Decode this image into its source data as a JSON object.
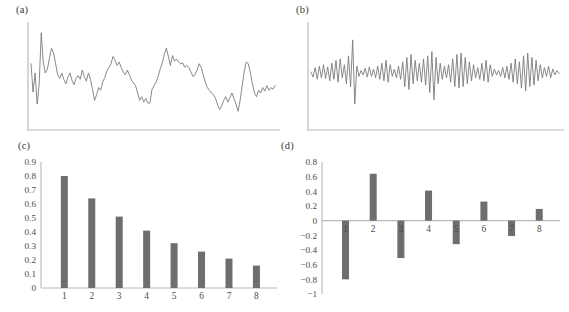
{
  "figure": {
    "background": "#ffffff",
    "line_color": "#7c7c7c",
    "axis_color": "#b9b9b9",
    "bar_color": "#6e6e6e",
    "text_color": "#4a4a4a"
  },
  "panels": {
    "a": {
      "label": "(a)"
    },
    "b": {
      "label": "(b)"
    },
    "c": {
      "label": "(c)"
    },
    "d": {
      "label": "(d)"
    }
  },
  "chart_data": [
    {
      "id": "a",
      "type": "line",
      "title": "(a)",
      "xlabel": "",
      "ylabel": "",
      "grid": false,
      "legend": null,
      "axis_ticks": false,
      "description": "Smoothly varying positively autocorrelated time series",
      "x": [
        0,
        1,
        2,
        3,
        4,
        5,
        6,
        7,
        8,
        9,
        10,
        11,
        12,
        13,
        14,
        15,
        16,
        17,
        18,
        19,
        20,
        21,
        22,
        23,
        24,
        25,
        26,
        27,
        28,
        29,
        30,
        31,
        32,
        33,
        34,
        35,
        36,
        37,
        38,
        39,
        40,
        41,
        42,
        43,
        44,
        45,
        46,
        47,
        48,
        49,
        50,
        51,
        52,
        53,
        54,
        55,
        56,
        57,
        58,
        59,
        60,
        61,
        62,
        63,
        64,
        65,
        66,
        67,
        68,
        69,
        70,
        71,
        72,
        73,
        74,
        75,
        76,
        77,
        78,
        79,
        80,
        81,
        82,
        83,
        84,
        85,
        86,
        87,
        88,
        89,
        90,
        91,
        92,
        93,
        94,
        95,
        96,
        97,
        98,
        99,
        100,
        101,
        102,
        103,
        104,
        105,
        106,
        107,
        108,
        109,
        110,
        111,
        112,
        113,
        114,
        115,
        116,
        117,
        118,
        119
      ],
      "values": [
        0.62,
        0.31,
        0.52,
        0.18,
        0.4,
        0.96,
        0.63,
        0.52,
        0.56,
        0.68,
        0.79,
        0.74,
        0.62,
        0.5,
        0.46,
        0.52,
        0.45,
        0.4,
        0.47,
        0.52,
        0.44,
        0.39,
        0.46,
        0.49,
        0.45,
        0.55,
        0.48,
        0.43,
        0.52,
        0.45,
        0.34,
        0.22,
        0.28,
        0.36,
        0.33,
        0.42,
        0.47,
        0.54,
        0.58,
        0.62,
        0.7,
        0.66,
        0.6,
        0.64,
        0.58,
        0.53,
        0.5,
        0.55,
        0.5,
        0.44,
        0.41,
        0.38,
        0.3,
        0.22,
        0.26,
        0.2,
        0.24,
        0.19,
        0.19,
        0.34,
        0.38,
        0.42,
        0.48,
        0.56,
        0.63,
        0.72,
        0.79,
        0.7,
        0.6,
        0.71,
        0.65,
        0.67,
        0.64,
        0.62,
        0.63,
        0.58,
        0.6,
        0.58,
        0.53,
        0.48,
        0.5,
        0.55,
        0.62,
        0.58,
        0.5,
        0.42,
        0.36,
        0.33,
        0.3,
        0.28,
        0.24,
        0.17,
        0.12,
        0.16,
        0.22,
        0.26,
        0.2,
        0.25,
        0.3,
        0.24,
        0.18,
        0.1,
        0.22,
        0.38,
        0.54,
        0.64,
        0.62,
        0.52,
        0.4,
        0.3,
        0.26,
        0.33,
        0.3,
        0.36,
        0.32,
        0.38,
        0.33,
        0.36,
        0.34,
        0.38
      ]
    },
    {
      "id": "b",
      "type": "line",
      "title": "(b)",
      "xlabel": "",
      "ylabel": "",
      "grid": false,
      "legend": null,
      "axis_ticks": false,
      "description": "Rapidly oscillating negatively autocorrelated time series",
      "x": [
        0,
        1,
        2,
        3,
        4,
        5,
        6,
        7,
        8,
        9,
        10,
        11,
        12,
        13,
        14,
        15,
        16,
        17,
        18,
        19,
        20,
        21,
        22,
        23,
        24,
        25,
        26,
        27,
        28,
        29,
        30,
        31,
        32,
        33,
        34,
        35,
        36,
        37,
        38,
        39,
        40,
        41,
        42,
        43,
        44,
        45,
        46,
        47,
        48,
        49,
        50,
        51,
        52,
        53,
        54,
        55,
        56,
        57,
        58,
        59,
        60,
        61,
        62,
        63,
        64,
        65,
        66,
        67,
        68,
        69,
        70,
        71,
        72,
        73,
        74,
        75,
        76,
        77,
        78,
        79,
        80,
        81,
        82,
        83,
        84,
        85,
        86,
        87,
        88,
        89,
        90,
        91,
        92,
        93,
        94,
        95,
        96,
        97,
        98,
        99,
        100,
        101,
        102,
        103,
        104,
        105,
        106,
        107,
        108,
        109,
        110,
        111,
        112,
        113,
        114,
        115,
        116,
        117,
        118,
        119
      ],
      "values": [
        0.5,
        0.43,
        0.56,
        0.4,
        0.58,
        0.42,
        0.6,
        0.41,
        0.57,
        0.38,
        0.62,
        0.4,
        0.66,
        0.36,
        0.68,
        0.42,
        0.6,
        0.34,
        0.72,
        0.3,
        0.94,
        0.06,
        0.58,
        0.44,
        0.52,
        0.46,
        0.55,
        0.43,
        0.57,
        0.44,
        0.54,
        0.42,
        0.58,
        0.4,
        0.62,
        0.38,
        0.66,
        0.36,
        0.6,
        0.44,
        0.54,
        0.42,
        0.58,
        0.4,
        0.64,
        0.3,
        0.7,
        0.26,
        0.74,
        0.34,
        0.66,
        0.38,
        0.62,
        0.36,
        0.68,
        0.32,
        0.72,
        0.22,
        0.78,
        0.12,
        0.7,
        0.34,
        0.62,
        0.4,
        0.58,
        0.42,
        0.6,
        0.36,
        0.68,
        0.3,
        0.74,
        0.28,
        0.76,
        0.3,
        0.7,
        0.34,
        0.64,
        0.38,
        0.6,
        0.42,
        0.56,
        0.4,
        0.62,
        0.38,
        0.66,
        0.36,
        0.6,
        0.44,
        0.54,
        0.46,
        0.52,
        0.44,
        0.56,
        0.42,
        0.58,
        0.4,
        0.62,
        0.36,
        0.68,
        0.34,
        0.64,
        0.28,
        0.72,
        0.24,
        0.76,
        0.3,
        0.7,
        0.32,
        0.66,
        0.38,
        0.6,
        0.42,
        0.56,
        0.44,
        0.58,
        0.42,
        0.54,
        0.46,
        0.52,
        0.48
      ]
    },
    {
      "id": "c",
      "type": "bar",
      "title": "(c)",
      "xlabel": "",
      "ylabel": "",
      "grid": false,
      "legend": null,
      "categories": [
        "1",
        "2",
        "3",
        "4",
        "5",
        "6",
        "7",
        "8"
      ],
      "values": [
        0.8,
        0.64,
        0.51,
        0.41,
        0.32,
        0.26,
        0.21,
        0.16
      ],
      "ylim": [
        0,
        0.9
      ],
      "ytick_labels": [
        "0.9",
        "0.8",
        "0.7",
        "0.6",
        "0.5",
        "0.4",
        "0.3",
        "0.2",
        "0.1",
        "0"
      ],
      "ytick_values": [
        0.9,
        0.8,
        0.7,
        0.6,
        0.5,
        0.4,
        0.3,
        0.2,
        0.1,
        0
      ],
      "description": "Autocorrelation function decaying exponentially, all positive"
    },
    {
      "id": "d",
      "type": "bar",
      "title": "(d)",
      "xlabel": "",
      "ylabel": "",
      "grid": false,
      "legend": null,
      "categories": [
        "1",
        "2",
        "3",
        "4",
        "5",
        "6",
        "7",
        "8"
      ],
      "values": [
        -0.8,
        0.64,
        -0.51,
        0.41,
        -0.32,
        0.26,
        -0.21,
        0.16
      ],
      "ylim": [
        -1,
        0.8
      ],
      "ytick_labels": [
        "0.8",
        "0.6",
        "0.4",
        "0.2",
        "0",
        "−0.2",
        "−0.4",
        "−0.6",
        "−0.8",
        "−1"
      ],
      "ytick_values": [
        0.8,
        0.6,
        0.4,
        0.2,
        0,
        -0.2,
        -0.4,
        -0.6,
        -0.8,
        -1
      ],
      "description": "Autocorrelation function decaying exponentially with alternating sign"
    }
  ]
}
